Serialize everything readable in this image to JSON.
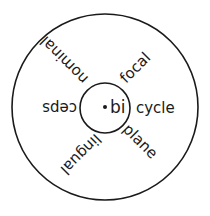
{
  "diagram": {
    "type": "word-wheel",
    "center": {
      "prefix": "bi"
    },
    "spokes": [
      {
        "word": "cycle",
        "angle": 0
      },
      {
        "word": "focal",
        "angle": -45
      },
      {
        "word": "nominal",
        "angle": -135
      },
      {
        "word": "ceps",
        "angle": 180
      },
      {
        "word": "lingual",
        "angle": 135
      },
      {
        "word": "plane",
        "angle": 45
      }
    ],
    "colors": {
      "stroke": "#1a1a1a",
      "background": "#ffffff"
    }
  }
}
